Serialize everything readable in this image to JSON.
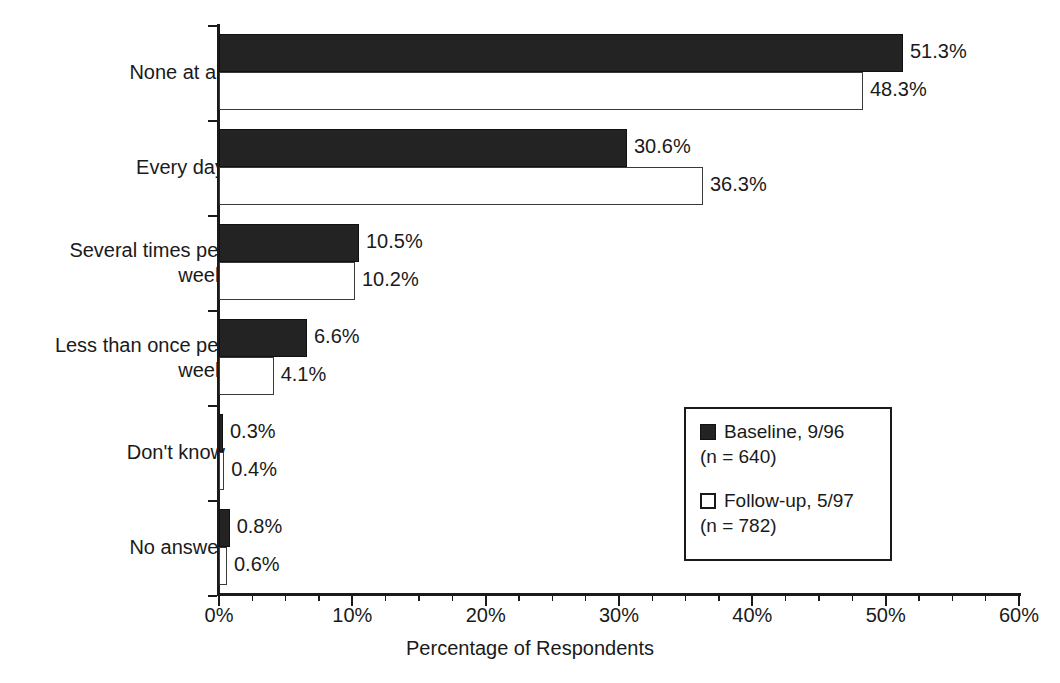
{
  "chart_data": {
    "type": "bar",
    "orientation": "horizontal",
    "title": "",
    "xlabel": "Percentage of Respondents",
    "ylabel": "",
    "xlim": [
      0,
      60
    ],
    "xticks": [
      "0%",
      "10%",
      "20%",
      "30%",
      "40%",
      "50%",
      "60%"
    ],
    "xtick_values": [
      0,
      10,
      20,
      30,
      40,
      50,
      60
    ],
    "minor_tick_step": 2.5,
    "grid": false,
    "legend_position": "center-right",
    "categories": [
      "None at all",
      "Every day",
      "Several times per\nweek",
      "Less than once per\nweek",
      "Don't know",
      "No answer"
    ],
    "series": [
      {
        "name": "Baseline, 9/96",
        "n_label": "(n = 640)",
        "n": 640,
        "color": "#232323",
        "values": [
          51.3,
          30.6,
          10.5,
          6.6,
          0.3,
          0.8
        ],
        "labels": [
          "51.3%",
          "30.6%",
          "10.5%",
          "6.6%",
          "0.3%",
          "0.8%"
        ]
      },
      {
        "name": "Follow-up, 5/97",
        "n_label": "(n = 782)",
        "n": 782,
        "color": "#ffffff",
        "values": [
          48.3,
          36.3,
          10.2,
          4.1,
          0.4,
          0.6
        ],
        "labels": [
          "48.3%",
          "36.3%",
          "10.2%",
          "4.1%",
          "0.4%",
          "0.6%"
        ]
      }
    ]
  },
  "legend": {
    "entries": [
      {
        "label": "Baseline, 9/96",
        "sub": "(n = 640)",
        "swatch": "filled-square-dark"
      },
      {
        "label": "Follow-up, 5/97",
        "sub": "(n = 782)",
        "swatch": "open-square-light"
      }
    ]
  }
}
